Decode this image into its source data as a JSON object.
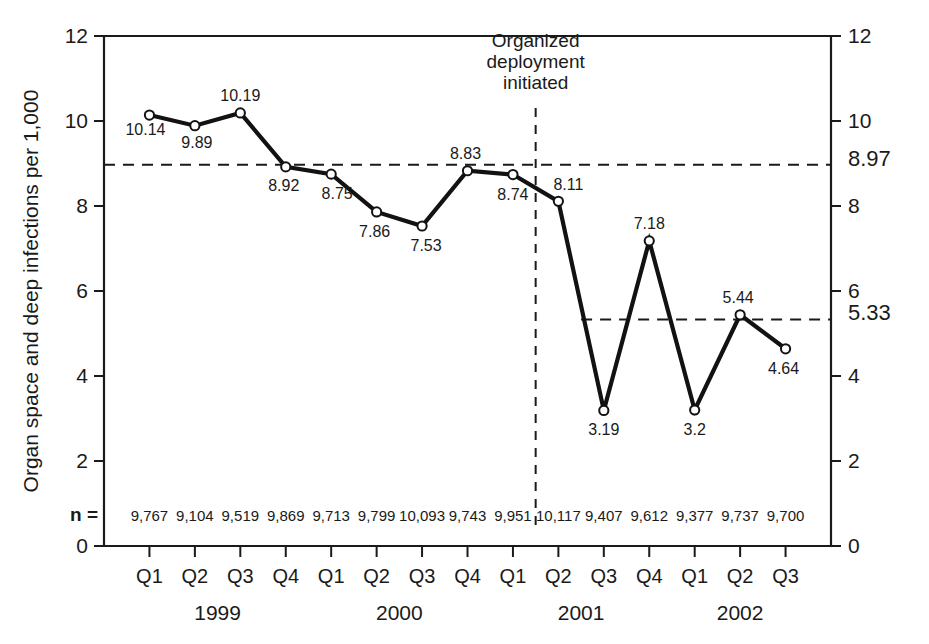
{
  "chart_data": {
    "type": "line",
    "title": "",
    "xlabel": "",
    "ylabel": "Organ space and deep infections per 1,000",
    "ylim": [
      0,
      12
    ],
    "y_ticks": [
      0,
      2,
      4,
      6,
      8,
      10,
      12
    ],
    "y_tick_labels_left": [
      "0",
      "2",
      "4",
      "6",
      "8",
      "10",
      "12"
    ],
    "y_tick_labels_right": [
      "0",
      "2",
      "4",
      "6",
      "8",
      "10",
      "12"
    ],
    "grid": false,
    "legend": "none",
    "categories": [
      "Q1",
      "Q2",
      "Q3",
      "Q4",
      "Q1",
      "Q2",
      "Q3",
      "Q4",
      "Q1",
      "Q2",
      "Q3",
      "Q4",
      "Q1",
      "Q2",
      "Q3"
    ],
    "years": [
      {
        "label": "1999",
        "start_index": 0,
        "end_index": 3
      },
      {
        "label": "2000",
        "start_index": 4,
        "end_index": 7
      },
      {
        "label": "2001",
        "start_index": 8,
        "end_index": 11
      },
      {
        "label": "2002",
        "start_index": 12,
        "end_index": 14
      }
    ],
    "values": [
      10.14,
      9.89,
      10.19,
      8.92,
      8.75,
      7.86,
      7.53,
      8.83,
      8.74,
      8.11,
      3.19,
      7.18,
      3.2,
      5.44,
      4.64
    ],
    "value_labels": [
      "10.14",
      "9.89",
      "10.19",
      "8.92",
      "8.75",
      "7.86",
      "7.53",
      "8.83",
      "8.74",
      "8.11",
      "3.19",
      "7.18",
      "3.2",
      "5.44",
      "4.64"
    ],
    "n_row_label": "n =",
    "n_values": [
      "9,767",
      "9,104",
      "9,519",
      "9,869",
      "9,713",
      "9,799",
      "10,093",
      "9,743",
      "9,951",
      "10,117",
      "9,407",
      "9,612",
      "9,377",
      "9,737",
      "9,700"
    ],
    "reference_lines": [
      {
        "name": "pre-intervention-mean",
        "value": 8.97,
        "label": "8.97",
        "start_index": 0,
        "end_index": 14
      },
      {
        "name": "post-intervention-mean",
        "value": 5.33,
        "label": "5.33",
        "start_index": 9.5,
        "end_index": 14.5
      }
    ],
    "event_marker": {
      "name": "organized-deployment",
      "lines": [
        "Organized",
        "deployment",
        "initiated"
      ],
      "between_index": 8.5
    },
    "colors": {
      "line": "#121212",
      "marker_fill": "#ffffff",
      "axis": "#1a1a1a",
      "background": "#ffffff",
      "reference": "#1a1a1a"
    }
  }
}
